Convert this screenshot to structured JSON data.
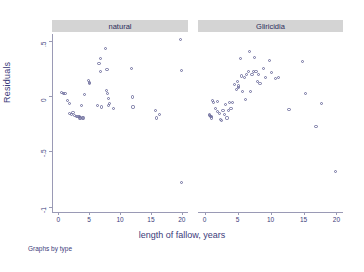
{
  "chart_data": {
    "type": "scatter",
    "title": "",
    "xlabel": "length of fallow, years",
    "ylabel": "Residuals",
    "caption": "Graphs by type",
    "xlim": [
      -1,
      21
    ],
    "ylim": [
      -1.05,
      0.56
    ],
    "xticks": [
      0,
      5,
      10,
      15,
      20
    ],
    "xticklabels": [
      "0",
      "5",
      "10",
      "15",
      "20"
    ],
    "yticks": [
      0.5,
      0,
      -0.5,
      -1
    ],
    "yticklabels": [
      ".5",
      "0",
      "-.5",
      "-1"
    ],
    "grid": false,
    "legend": "none",
    "marker": "open-circle",
    "marker_color": "#6f6f9e",
    "panels": [
      {
        "label": "natural",
        "points": [
          [
            0.6,
            0.03
          ],
          [
            0.9,
            0.02
          ],
          [
            1.1,
            0.02
          ],
          [
            1.5,
            -0.04
          ],
          [
            1.8,
            -0.07
          ],
          [
            1.9,
            -0.16
          ],
          [
            2.1,
            -0.17
          ],
          [
            2.4,
            -0.15
          ],
          [
            2.6,
            -0.18
          ],
          [
            2.9,
            -0.19
          ],
          [
            3.2,
            -0.19
          ],
          [
            3.4,
            -0.2
          ],
          [
            3.5,
            -0.19
          ],
          [
            3.6,
            -0.2
          ],
          [
            3.8,
            -0.09
          ],
          [
            4.0,
            -0.2
          ],
          [
            4.1,
            -0.2
          ],
          [
            4.3,
            0.01
          ],
          [
            4.9,
            0.14
          ],
          [
            5.0,
            0.11
          ],
          [
            5.1,
            0.12
          ],
          [
            6.4,
            -0.09
          ],
          [
            6.6,
            0.29
          ],
          [
            6.8,
            0.22
          ],
          [
            6.9,
            0.34
          ],
          [
            7.0,
            -0.1
          ],
          [
            7.6,
            0.43
          ],
          [
            7.8,
            0.05
          ],
          [
            7.9,
            0.24
          ],
          [
            8.0,
            0.02
          ],
          [
            8.1,
            -0.02
          ],
          [
            8.2,
            -0.09
          ],
          [
            8.3,
            -0.07
          ],
          [
            9.0,
            -0.11
          ],
          [
            11.9,
            0.25
          ],
          [
            12.0,
            -0.01
          ],
          [
            12.1,
            -0.1
          ],
          [
            15.7,
            -0.13
          ],
          [
            15.9,
            -0.2
          ],
          [
            16.4,
            -0.17
          ],
          [
            19.8,
            0.51
          ],
          [
            19.9,
            0.23
          ],
          [
            19.9,
            -0.78
          ]
        ]
      },
      {
        "label": "Gliricidia",
        "points": [
          [
            0.7,
            -0.17
          ],
          [
            0.8,
            -0.18
          ],
          [
            0.9,
            -0.19
          ],
          [
            1.0,
            -0.2
          ],
          [
            1.1,
            -0.19
          ],
          [
            1.2,
            -0.04
          ],
          [
            1.4,
            -0.06
          ],
          [
            1.6,
            -0.11
          ],
          [
            1.9,
            -0.14
          ],
          [
            2.0,
            -0.05
          ],
          [
            2.2,
            -0.16
          ],
          [
            2.4,
            -0.21
          ],
          [
            2.6,
            -0.22
          ],
          [
            2.8,
            -0.13
          ],
          [
            3.0,
            -0.17
          ],
          [
            3.2,
            -0.08
          ],
          [
            3.4,
            -0.2
          ],
          [
            3.6,
            -0.13
          ],
          [
            3.8,
            -0.06
          ],
          [
            4.0,
            -0.11
          ],
          [
            4.2,
            -0.06
          ],
          [
            4.6,
            0.1
          ],
          [
            4.8,
            0.06
          ],
          [
            5.0,
            0.13
          ],
          [
            5.1,
            0.09
          ],
          [
            5.2,
            0.08
          ],
          [
            5.4,
            0.34
          ],
          [
            5.6,
            0.18
          ],
          [
            5.8,
            0.04
          ],
          [
            6.0,
            0.17
          ],
          [
            6.2,
            -0.03
          ],
          [
            6.4,
            0.19
          ],
          [
            6.6,
            0.22
          ],
          [
            6.8,
            0.4
          ],
          [
            7.0,
            0.04
          ],
          [
            7.2,
            0.19
          ],
          [
            7.4,
            0.22
          ],
          [
            7.6,
            0.35
          ],
          [
            7.8,
            0.22
          ],
          [
            8.0,
            0.13
          ],
          [
            8.2,
            0.19
          ],
          [
            8.4,
            0.11
          ],
          [
            9.0,
            0.25
          ],
          [
            9.2,
            0.17
          ],
          [
            9.8,
            0.32
          ],
          [
            10.2,
            0.21
          ],
          [
            10.8,
            0.16
          ],
          [
            11.2,
            0.17
          ],
          [
            12.8,
            -0.12
          ],
          [
            14.8,
            0.31
          ],
          [
            15.3,
            0.02
          ],
          [
            16.9,
            -0.28
          ],
          [
            17.8,
            -0.07
          ],
          [
            19.8,
            -0.68
          ]
        ]
      }
    ]
  }
}
